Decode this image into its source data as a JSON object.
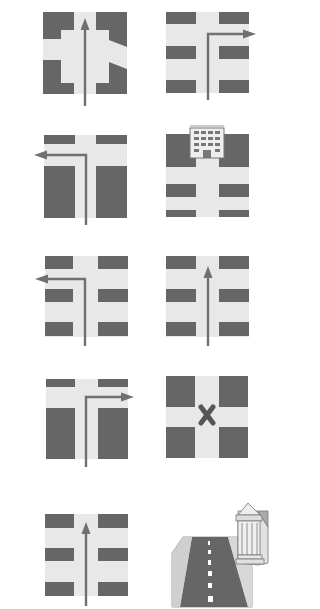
{
  "colors": {
    "background": "#ffffff",
    "block": "#666666",
    "road": "#e8e8e8",
    "arrow": "#707070",
    "marker": "#555555",
    "building_fill": "#dddddd",
    "building_line": "#777777"
  },
  "diagram": {
    "title": "",
    "tiles": [
      {
        "id": 1,
        "description": "Four-way junction with notched blocks, arrow straight ahead",
        "direction": "straight"
      },
      {
        "id": 2,
        "description": "Grid of streets, arrow turns right at first crossing",
        "direction": "right-turn"
      },
      {
        "id": 3,
        "description": "T-junction, arrow turns left",
        "direction": "left-turn"
      },
      {
        "id": 4,
        "description": "Street leads up to an office building at the end",
        "direction": "destination-building"
      },
      {
        "id": 5,
        "description": "Grid of streets, arrow turns left at first crossing",
        "direction": "left-turn"
      },
      {
        "id": 6,
        "description": "Grid of streets, arrow straight ahead",
        "direction": "straight"
      },
      {
        "id": 7,
        "description": "T-junction, arrow turns right",
        "direction": "right-turn"
      },
      {
        "id": 8,
        "description": "Crossroads with X mark at the intersection",
        "direction": "x-mark"
      },
      {
        "id": 9,
        "description": "Grid of streets, arrow straight ahead",
        "direction": "straight"
      },
      {
        "id": 10,
        "description": "Perspective road with dashed centre line leading to a columned building",
        "direction": "perspective-destination"
      }
    ]
  }
}
